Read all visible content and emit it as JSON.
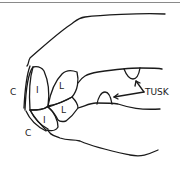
{
  "diagram": {
    "labels": {
      "c_upper": "C",
      "i_upper": "I",
      "l_upper": "L",
      "c_lower": "C",
      "i_lower": "I",
      "l_lower": "L",
      "tusk": "TUSK"
    },
    "colors": {
      "line": "#1a1a1a",
      "top_rule": "#8a8a8a",
      "background": "#ffffff"
    }
  }
}
